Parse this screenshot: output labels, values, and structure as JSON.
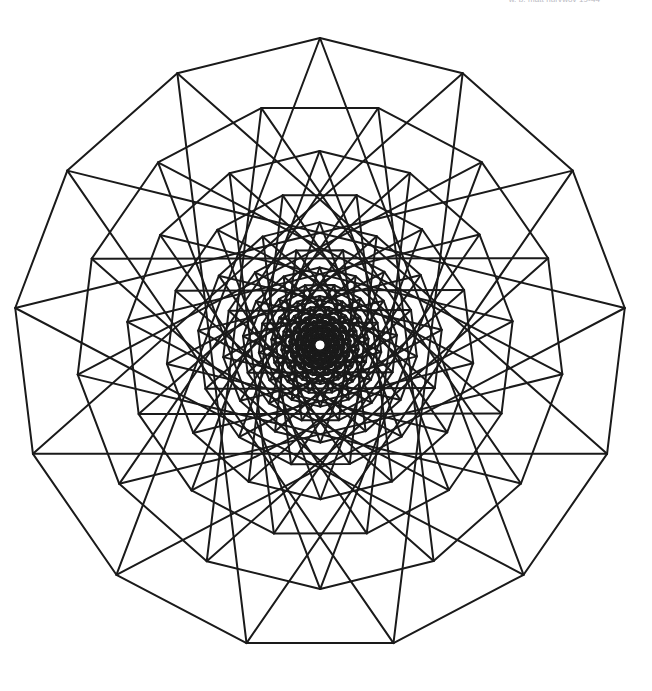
{
  "figure": {
    "caption_text": "w. b. matt nurvwov 19-44",
    "background_color": "#ffffff",
    "stroke_color": "#1a1a1a",
    "stroke_width": 2.0,
    "canvas": {
      "width": 652,
      "height": 691
    }
  },
  "chart_data": {
    "type": "line",
    "xlabel": "",
    "ylabel": "",
    "geometry": {
      "polygon_sides": 13,
      "center_x": 320,
      "center_y": 345,
      "outer_radius": 307,
      "start_angle_deg": -90,
      "scale_ratio": 0.795,
      "rotation_step_deg": 13.8,
      "levels": 14,
      "chord_step": 5,
      "draw_polygon_edges": true,
      "draw_star_chords": true,
      "center_dot_radius": 4,
      "center_dot_color": "#ffffff"
    },
    "grid": false,
    "legend": null,
    "outer_vertices": [
      {
        "index": 0,
        "x": 320,
        "y": 38
      },
      {
        "index": 1,
        "x": 455,
        "y": 69
      },
      {
        "index": 2,
        "x": 558,
        "y": 160
      },
      {
        "index": 3,
        "x": 609,
        "y": 284
      },
      {
        "index": 4,
        "x": 602,
        "y": 418
      },
      {
        "index": 5,
        "x": 540,
        "y": 537
      },
      {
        "index": 6,
        "x": 433,
        "y": 619
      },
      {
        "index": 7,
        "x": 320,
        "y": 653
      },
      {
        "index": 8,
        "x": 207,
        "y": 619
      },
      {
        "index": 9,
        "x": 100,
        "y": 537
      },
      {
        "index": 10,
        "x": 38,
        "y": 418
      },
      {
        "index": 11,
        "x": 31,
        "y": 284
      },
      {
        "index": 12,
        "x": 82,
        "y": 160
      }
    ]
  }
}
